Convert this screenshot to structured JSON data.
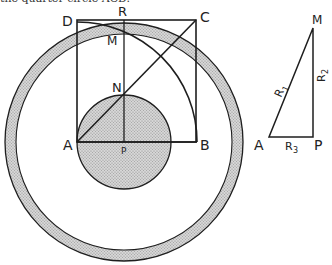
{
  "caption": "the quarter circle ACD.",
  "colors": {
    "stroke": "#1e1e1e",
    "fill_dotted": "#cfcfcf",
    "dot": "#8a8a8a",
    "background": "#ffffff"
  },
  "main_figure": {
    "labels": {
      "D": "D",
      "R": "R",
      "C": "C",
      "M": "M",
      "N": "N",
      "A": "A",
      "P": "P",
      "B": "B"
    }
  },
  "triangle": {
    "labels": {
      "M": "M",
      "A": "A",
      "P": "P",
      "R1": "R",
      "R1_sub": "1",
      "R2": "R",
      "R2_sub": "2",
      "R3": "R",
      "R3_sub": "3"
    }
  }
}
